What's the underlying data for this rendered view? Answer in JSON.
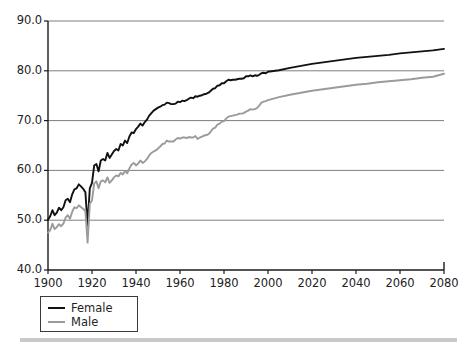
{
  "chart_data": {
    "type": "line",
    "title": "",
    "subtitle": "",
    "xlabel": "",
    "ylabel": "",
    "xlim": [
      1900,
      2080
    ],
    "ylim": [
      40.0,
      90.0
    ],
    "grid": "horizontal",
    "legend_position": "below-left",
    "x_ticks": [
      "1900",
      "1920",
      "1940",
      "1960",
      "1980",
      "2000",
      "2020",
      "2040",
      "2060",
      "2080"
    ],
    "y_ticks": [
      "40.0",
      "50.0",
      "60.0",
      "70.0",
      "80.0",
      "90.0"
    ],
    "series": [
      {
        "name": "Female",
        "color": "#111111",
        "x": [
          1900,
          1901,
          1902,
          1903,
          1904,
          1905,
          1906,
          1907,
          1908,
          1909,
          1910,
          1911,
          1912,
          1913,
          1914,
          1915,
          1916,
          1917,
          1918,
          1919,
          1920,
          1921,
          1922,
          1923,
          1924,
          1925,
          1926,
          1927,
          1928,
          1929,
          1930,
          1931,
          1932,
          1933,
          1934,
          1935,
          1936,
          1937,
          1938,
          1939,
          1940,
          1941,
          1942,
          1943,
          1944,
          1945,
          1946,
          1947,
          1948,
          1949,
          1950,
          1951,
          1952,
          1953,
          1954,
          1955,
          1956,
          1957,
          1958,
          1959,
          1960,
          1961,
          1962,
          1963,
          1964,
          1965,
          1966,
          1967,
          1968,
          1969,
          1970,
          1971,
          1972,
          1973,
          1974,
          1975,
          1976,
          1977,
          1978,
          1979,
          1980,
          1981,
          1982,
          1983,
          1984,
          1985,
          1986,
          1987,
          1988,
          1989,
          1990,
          1991,
          1992,
          1993,
          1994,
          1995,
          1996,
          1997,
          1998,
          1999,
          2000,
          2005,
          2010,
          2015,
          2020,
          2025,
          2030,
          2035,
          2040,
          2045,
          2050,
          2055,
          2060,
          2065,
          2070,
          2075,
          2080
        ],
        "y": [
          50.1,
          50.8,
          52.0,
          51.0,
          51.5,
          52.5,
          52.0,
          52.6,
          54.0,
          54.3,
          53.6,
          55.2,
          56.2,
          56.4,
          57.2,
          56.8,
          56.3,
          55.6,
          49.0,
          56.4,
          57.5,
          61.0,
          61.3,
          59.8,
          62.0,
          62.3,
          62.0,
          63.5,
          62.5,
          63.2,
          63.9,
          64.3,
          64.0,
          65.3,
          65.0,
          66.0,
          65.5,
          66.8,
          67.6,
          67.5,
          68.3,
          68.8,
          69.4,
          69.0,
          69.7,
          70.2,
          71.0,
          71.5,
          72.0,
          72.3,
          72.6,
          72.8,
          73.1,
          73.2,
          73.6,
          73.5,
          73.3,
          73.3,
          73.4,
          73.8,
          73.7,
          74.0,
          73.9,
          74.1,
          74.4,
          74.6,
          74.5,
          74.9,
          74.8,
          75.0,
          75.1,
          75.3,
          75.4,
          75.6,
          76.0,
          76.4,
          76.5,
          77.0,
          77.1,
          77.5,
          77.5,
          77.9,
          78.2,
          78.1,
          78.2,
          78.2,
          78.3,
          78.4,
          78.4,
          78.5,
          78.9,
          78.9,
          79.1,
          78.9,
          79.1,
          79.0,
          79.2,
          79.5,
          79.6,
          79.5,
          79.8,
          80.1,
          80.6,
          81.0,
          81.4,
          81.7,
          82.0,
          82.3,
          82.6,
          82.8,
          83.0,
          83.2,
          83.5,
          83.7,
          83.9,
          84.1,
          84.4
        ]
      },
      {
        "name": "Male",
        "color": "#9b9b9b",
        "x": [
          1900,
          1901,
          1902,
          1903,
          1904,
          1905,
          1906,
          1907,
          1908,
          1909,
          1910,
          1911,
          1912,
          1913,
          1914,
          1915,
          1916,
          1917,
          1918,
          1919,
          1920,
          1921,
          1922,
          1923,
          1924,
          1925,
          1926,
          1927,
          1928,
          1929,
          1930,
          1931,
          1932,
          1933,
          1934,
          1935,
          1936,
          1937,
          1938,
          1939,
          1940,
          1941,
          1942,
          1943,
          1944,
          1945,
          1946,
          1947,
          1948,
          1949,
          1950,
          1951,
          1952,
          1953,
          1954,
          1955,
          1956,
          1957,
          1958,
          1959,
          1960,
          1961,
          1962,
          1963,
          1964,
          1965,
          1966,
          1967,
          1968,
          1969,
          1970,
          1971,
          1972,
          1973,
          1974,
          1975,
          1976,
          1977,
          1978,
          1979,
          1980,
          1981,
          1982,
          1983,
          1984,
          1985,
          1986,
          1987,
          1988,
          1989,
          1990,
          1991,
          1992,
          1993,
          1994,
          1995,
          1996,
          1997,
          1998,
          1999,
          2000,
          2005,
          2010,
          2015,
          2020,
          2025,
          2030,
          2035,
          2040,
          2045,
          2050,
          2055,
          2060,
          2065,
          2070,
          2075,
          2080
        ],
        "y": [
          47.5,
          48.0,
          49.3,
          48.2,
          48.6,
          49.2,
          48.8,
          49.3,
          50.5,
          51.0,
          50.3,
          51.7,
          52.6,
          52.4,
          53.0,
          52.6,
          52.3,
          51.8,
          45.5,
          53.3,
          54.0,
          57.4,
          57.8,
          56.4,
          57.8,
          58.0,
          57.6,
          58.6,
          57.5,
          58.0,
          58.6,
          59.0,
          58.8,
          59.5,
          59.2,
          59.9,
          59.4,
          60.4,
          61.2,
          61.5,
          61.0,
          61.4,
          62.0,
          61.5,
          61.8,
          62.3,
          63.0,
          63.5,
          63.8,
          64.0,
          64.4,
          64.8,
          65.3,
          65.4,
          66.0,
          65.8,
          65.8,
          65.8,
          66.2,
          66.5,
          66.4,
          66.6,
          66.6,
          66.5,
          66.7,
          66.6,
          66.6,
          66.9,
          66.3,
          66.6,
          66.8,
          67.0,
          67.1,
          67.3,
          67.8,
          68.4,
          68.6,
          69.2,
          69.4,
          69.8,
          69.9,
          70.4,
          70.8,
          70.9,
          71.0,
          71.1,
          71.2,
          71.4,
          71.4,
          71.5,
          71.8,
          72.0,
          72.3,
          72.2,
          72.3,
          72.5,
          73.0,
          73.6,
          73.8,
          73.9,
          74.1,
          74.7,
          75.2,
          75.6,
          76.0,
          76.3,
          76.6,
          76.9,
          77.2,
          77.4,
          77.7,
          77.9,
          78.1,
          78.3,
          78.6,
          78.8,
          79.4
        ]
      }
    ]
  },
  "axis": {
    "x_tick_values": [
      1900,
      1920,
      1940,
      1960,
      1980,
      2000,
      2020,
      2040,
      2060,
      2080
    ],
    "y_tick_values": [
      40.0,
      50.0,
      60.0,
      70.0,
      80.0,
      90.0
    ]
  },
  "legend": {
    "items": [
      {
        "label": "Female",
        "color": "#111111"
      },
      {
        "label": "Male",
        "color": "#9b9b9b"
      }
    ]
  }
}
